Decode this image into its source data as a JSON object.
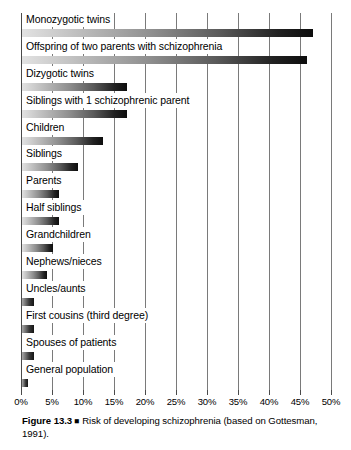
{
  "chart_data": {
    "type": "bar",
    "orientation": "horizontal",
    "title": "",
    "xlabel": "",
    "ylabel": "",
    "xlim": [
      0,
      50
    ],
    "xunit": "%",
    "grid": true,
    "legend": "none",
    "xticks": [
      "0%",
      "5%",
      "10%",
      "15%",
      "20%",
      "25%",
      "30%",
      "35%",
      "40%",
      "45%",
      "50%"
    ],
    "xtick_values": [
      0,
      5,
      10,
      15,
      20,
      25,
      30,
      35,
      40,
      45,
      50
    ],
    "categories": [
      "Monozygotic twins",
      "Offspring of two parents with schizophrenia",
      "Dizygotic twins",
      "Siblings with 1 schizophrenic parent",
      "Children",
      "Siblings",
      "Parents",
      "Half siblings",
      "Grandchildren",
      "Nephews/nieces",
      "Uncles/aunts",
      "First cousins (third degree)",
      "Spouses of patients",
      "General population"
    ],
    "values": [
      47,
      46,
      17,
      17,
      13,
      9,
      6,
      6,
      5,
      4,
      2,
      2,
      2,
      1
    ],
    "bar_gradient": [
      "#e2e2e2",
      "#0d0d0d"
    ],
    "gridline_color": "#7a7a7a"
  },
  "caption": {
    "figure_number": "Figure 13.3",
    "marker": "■",
    "text": "Risk of developing schizophrenia (based on Gottesman, 1991)."
  }
}
